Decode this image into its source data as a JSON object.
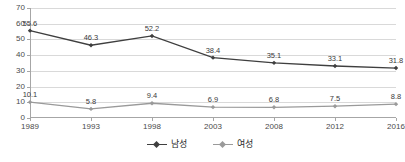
{
  "chart_data": {
    "type": "line",
    "title": "",
    "xlabel": "",
    "ylabel": "",
    "categories": [
      "1989",
      "1993",
      "1998",
      "2003",
      "2008",
      "2012",
      "2016"
    ],
    "ylim": [
      0,
      70
    ],
    "y_ticks": [
      0,
      10,
      20,
      30,
      40,
      50,
      60,
      70
    ],
    "y_tick_labels": [
      "0",
      "10",
      "20",
      "30",
      "40",
      "50",
      "60",
      "70"
    ],
    "grid": true,
    "legend_position": "bottom-center",
    "series": [
      {
        "name": "남성",
        "color": "#3f3f3f",
        "marker": "diamond",
        "values": [
          55.6,
          46.3,
          52.2,
          38.4,
          35.1,
          33.1,
          31.8
        ],
        "labels": [
          "55.6",
          "46.3",
          "52.2",
          "38.4",
          "35.1",
          "33.1",
          "31.8"
        ]
      },
      {
        "name": "여성",
        "color": "#9a9a9a",
        "marker": "diamond",
        "values": [
          10.1,
          5.8,
          9.4,
          6.9,
          6.8,
          7.5,
          8.8
        ],
        "labels": [
          "10.1",
          "5.8",
          "9.4",
          "6.9",
          "6.8",
          "7.5",
          "8.8"
        ]
      }
    ]
  },
  "legend": {
    "items": [
      {
        "label": "남성",
        "marker_name": "legend-marker-male"
      },
      {
        "label": "여성",
        "marker_name": "legend-marker-female"
      }
    ]
  },
  "colors": {
    "series_male": "#3f3f3f",
    "series_female": "#9a9a9a",
    "grid": "#d9d9d9",
    "axis": "#a6a6a6",
    "text": "#4a4a4a",
    "background": "#ffffff"
  }
}
